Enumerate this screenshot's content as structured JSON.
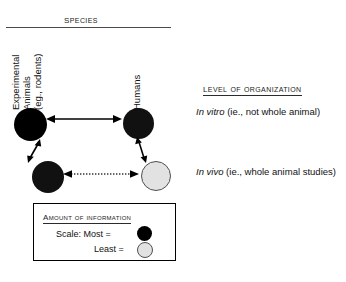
{
  "diagram": {
    "species_axis": {
      "heading": "SPECIES",
      "columns": [
        {
          "id": "experimental-animals",
          "lines": [
            "Experimental",
            "Animals",
            "(eg., rodents)"
          ]
        },
        {
          "id": "humans",
          "lines": [
            "Humans"
          ]
        }
      ]
    },
    "level_axis": {
      "heading": "LEVEL OF ORGANIZATION",
      "rows": [
        {
          "id": "in-vitro",
          "emphasis": "In vitro",
          "detail": " (ie., not whole animal)"
        },
        {
          "id": "in-vivo",
          "emphasis": "In vivo",
          "detail": " (ie., whole animal studies)"
        }
      ]
    },
    "nodes": [
      {
        "id": "experimental-in-vitro",
        "species": "Experimental Animals",
        "level": "In vitro",
        "information": "Most"
      },
      {
        "id": "humans-in-vitro",
        "species": "Humans",
        "level": "In vitro",
        "information": "Most"
      },
      {
        "id": "experimental-in-vivo",
        "species": "Experimental Animals",
        "level": "In vivo",
        "information": "Most"
      },
      {
        "id": "humans-in-vivo",
        "species": "Humans",
        "level": "In vivo",
        "information": "Least"
      }
    ],
    "connectors": [
      {
        "id": "top-horizontal",
        "from": "experimental-in-vitro",
        "to": "humans-in-vitro",
        "style": "solid",
        "heads": "both"
      },
      {
        "id": "bottom-horizontal",
        "from": "experimental-in-vivo",
        "to": "humans-in-vivo",
        "style": "dotted",
        "heads": "both"
      },
      {
        "id": "left-vertical",
        "from": "experimental-in-vitro",
        "to": "experimental-in-vivo",
        "style": "solid",
        "heads": "both"
      },
      {
        "id": "right-vertical",
        "from": "humans-in-vitro",
        "to": "humans-in-vivo",
        "style": "solid",
        "heads": "both"
      }
    ]
  },
  "legend": {
    "title": "AMOUNT OF INFORMATION",
    "rows": [
      {
        "id": "most",
        "label": "Scale:  Most  =",
        "swatch": "solid-black"
      },
      {
        "id": "least",
        "label": "Least  =",
        "swatch": "light-gray"
      }
    ]
  },
  "colors": {
    "most": "#000000",
    "least": "#e2e2e2",
    "least_border": "#4f4f4f",
    "rule": "#4a4a4a",
    "text": "#111111"
  }
}
